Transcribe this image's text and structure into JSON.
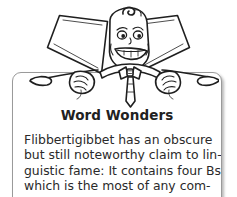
{
  "page": {
    "background_color": "#ffffff",
    "illustration": {
      "name": "w-letter-mascot",
      "description": "Cartoon letter W character with a smiling face, curl of hair, bow tie and necktie, arms resting on the card",
      "line_color": "#1f1f1f",
      "fill_color": "#ffffff",
      "shading_color": "#c8c8c8"
    }
  },
  "card": {
    "background_color": "#ffffff",
    "border_color": "#9a9a9a",
    "title": "Word Wonders",
    "title_color": "#212121",
    "body_color": "#2a2a2a",
    "body_lines": [
      "Flibbertigibbet has an obscure",
      "but still noteworthy claim to lin-",
      "guistic fame: It contains four Bs,",
      "which is the most of any com-"
    ],
    "body_text": "Flibbertigibbet has an obscure but still noteworthy claim to linguistic fame: It contains four Bs, which is the most of any com-"
  }
}
